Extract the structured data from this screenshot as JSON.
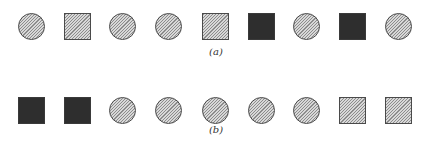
{
  "figure": {
    "panels": [
      {
        "label": "(a)",
        "sequence": [
          {
            "shape": "circle",
            "fill": "hatched"
          },
          {
            "shape": "square",
            "fill": "hatched"
          },
          {
            "shape": "circle",
            "fill": "hatched"
          },
          {
            "shape": "circle",
            "fill": "hatched"
          },
          {
            "shape": "square",
            "fill": "hatched"
          },
          {
            "shape": "square",
            "fill": "black"
          },
          {
            "shape": "circle",
            "fill": "hatched"
          },
          {
            "shape": "square",
            "fill": "black"
          },
          {
            "shape": "circle",
            "fill": "hatched"
          }
        ]
      },
      {
        "label": "(b)",
        "sequence": [
          {
            "shape": "square",
            "fill": "black"
          },
          {
            "shape": "square",
            "fill": "black"
          },
          {
            "shape": "circle",
            "fill": "hatched"
          },
          {
            "shape": "circle",
            "fill": "hatched"
          },
          {
            "shape": "circle",
            "fill": "hatched"
          },
          {
            "shape": "circle",
            "fill": "hatched"
          },
          {
            "shape": "circle",
            "fill": "hatched"
          },
          {
            "shape": "square",
            "fill": "hatched"
          },
          {
            "shape": "square",
            "fill": "hatched"
          }
        ]
      }
    ],
    "colors": {
      "hatched_fill": "#d8d8d8",
      "hatch_line": "#8c8c8c",
      "outline": "#4a4a4a",
      "black_fill": "#2e2e2e",
      "background": "#ffffff"
    }
  }
}
